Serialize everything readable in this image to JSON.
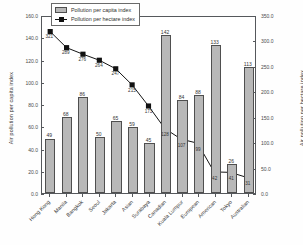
{
  "chart_data": {
    "type": "bar",
    "title": "",
    "xlabel": "",
    "ylabel": "Air pollution per capita index",
    "ylabel_right": "Air pollution per hectare index",
    "ylim": [
      0,
      160
    ],
    "ylim_right": [
      0,
      350
    ],
    "yticks": [
      "0.0",
      "20.0",
      "40.0",
      "60.0",
      "80.0",
      "100.0",
      "120.0",
      "140.0",
      "160.0"
    ],
    "yticks_right": [
      "0.0",
      "50.0",
      "100.0",
      "150.0",
      "200.0",
      "250.0",
      "300.0",
      "350.0"
    ],
    "grid": false,
    "legend_position": "top-left-inside",
    "categories": [
      "Hong Kong",
      "Manila",
      "Bangkok",
      "Seoul",
      "Jakarta",
      "Asian",
      "Surabaya",
      "Canadian",
      "Kuala Lumpur",
      "European",
      "American",
      "Tokyo",
      "Australian"
    ],
    "series": [
      {
        "name": "Pollution per capita index",
        "type": "bar",
        "axis": "left",
        "color": "#b8b8b8",
        "values": [
          49,
          68,
          86,
          50,
          65,
          59,
          45,
          142,
          84,
          88,
          133,
          26,
          113
        ]
      },
      {
        "name": "Pollution per hectare index",
        "type": "line",
        "axis": "right",
        "color": "#111111",
        "values": [
          321,
          289,
          276,
          264,
          247,
          215,
          173,
          128,
          107,
          99,
          42,
          41,
          31
        ]
      }
    ]
  },
  "legend": {
    "items": [
      {
        "label": "Pollution per capita index"
      },
      {
        "label": "Pollution per hectare index"
      }
    ]
  },
  "caption": {
    "text": ""
  }
}
